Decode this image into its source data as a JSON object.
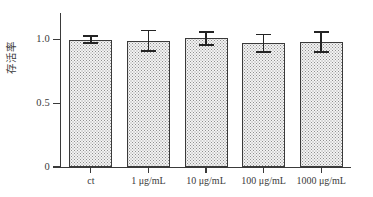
{
  "chart_data": {
    "type": "bar",
    "title": "",
    "subtitle": "",
    "xlabel": "",
    "ylabel": "存活率",
    "categories": [
      "ct",
      "1 μg/mL",
      "10 μg/mL",
      "100 μg/mL",
      "1000 μg/mL"
    ],
    "values": [
      1.0,
      0.99,
      1.01,
      0.97,
      0.98
    ],
    "errors": [
      0.03,
      0.08,
      0.05,
      0.07,
      0.08
    ],
    "ylim": [
      0,
      1.2
    ],
    "yticks": [
      0,
      0.5,
      1.0
    ],
    "ytick_labels": [
      "0",
      "0.5",
      "1.0"
    ],
    "grid": false,
    "legend": null,
    "series": [
      {
        "name": "存活率",
        "values": [
          1.0,
          0.99,
          1.01,
          0.97,
          0.98
        ],
        "errors": [
          0.03,
          0.08,
          0.05,
          0.07,
          0.08
        ]
      }
    ],
    "annotations": [],
    "colors": {
      "bar_fill": "#f3f3f3",
      "bar_pattern": "#8f8f8f",
      "bar_edge": "#3a3a3a",
      "axis": "#3a3a3a",
      "error_bar": "#242424",
      "text": "#3a3a3a",
      "background": "#ffffff"
    }
  }
}
